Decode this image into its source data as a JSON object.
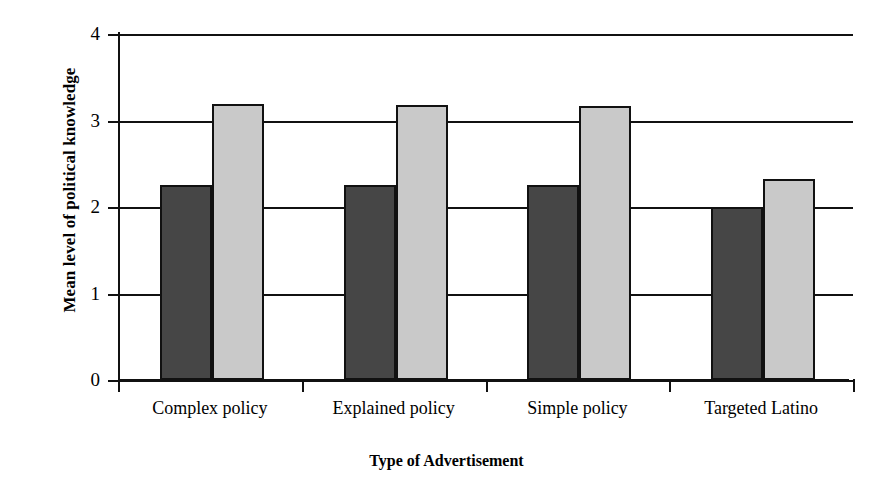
{
  "chart_data": {
    "type": "bar",
    "title": "",
    "xlabel": "Type of Advertisement",
    "ylabel": "Mean level of political knowledge",
    "categories": [
      "Complex policy",
      "Explained policy",
      "Simple policy",
      "Targeted Latino"
    ],
    "series": [
      {
        "name": "series-1-dark",
        "color": "#464646",
        "values": [
          2.26,
          2.26,
          2.25,
          2.0
        ]
      },
      {
        "name": "series-2-light",
        "color": "#c9c9c9",
        "values": [
          3.19,
          3.18,
          3.17,
          2.32
        ]
      }
    ],
    "ylim": [
      0,
      4
    ],
    "ytick_labels": [
      "0",
      "1",
      "2",
      "3",
      "4"
    ],
    "ytick_values": [
      0,
      1,
      2,
      3,
      4
    ],
    "grid": true,
    "legend": "none",
    "annotations": []
  }
}
